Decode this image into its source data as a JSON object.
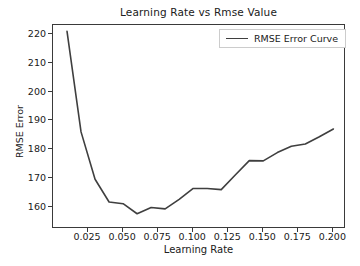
{
  "chart_data": {
    "type": "line",
    "title": "Learning Rate vs Rmse Value",
    "xlabel": "Learning Rate",
    "ylabel": "RMSE Error",
    "xlim": [
      0.0,
      0.209
    ],
    "ylim": [
      152.2,
      223.2
    ],
    "grid": false,
    "legend_position": "upper right",
    "line_color": "#3f3f3f",
    "xticks": [
      0.025,
      0.05,
      0.075,
      0.1,
      0.125,
      0.15,
      0.175,
      0.2
    ],
    "xtick_labels": [
      "0.025",
      "0.050",
      "0.075",
      "0.100",
      "0.125",
      "0.150",
      "0.175",
      "0.200"
    ],
    "yticks": [
      160,
      170,
      180,
      190,
      200,
      210,
      220
    ],
    "ytick_labels": [
      "160",
      "170",
      "180",
      "190",
      "200",
      "210",
      "220"
    ],
    "series": [
      {
        "name": "RMSE Error Curve",
        "x": [
          0.01,
          0.02,
          0.03,
          0.04,
          0.05,
          0.06,
          0.07,
          0.08,
          0.09,
          0.1,
          0.11,
          0.12,
          0.13,
          0.14,
          0.15,
          0.16,
          0.17,
          0.18,
          0.19,
          0.2
        ],
        "y": [
          221.0,
          186.0,
          169.5,
          161.6,
          161.0,
          157.5,
          159.7,
          159.2,
          162.5,
          166.3,
          166.3,
          165.9,
          171.0,
          176.0,
          175.9,
          178.8,
          181.0,
          181.8,
          184.3,
          187.0
        ]
      }
    ]
  },
  "legend": {
    "entries": [
      {
        "label": "RMSE Error Curve"
      }
    ]
  }
}
